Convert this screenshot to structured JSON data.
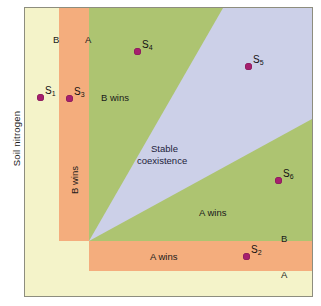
{
  "figure": {
    "type": "resource-competition-phase-diagram",
    "axis": {
      "y_label": "Soil nitrogen",
      "x_label": ""
    },
    "colors": {
      "background": "#f4f3c9",
      "neither_wins": "#f4f3c9",
      "b_wins_strip": "#f4ad7d",
      "green_region": "#adc471",
      "stable_coexistence": "#ccd0e8",
      "marker": "#a61f6e",
      "frame": "#8d8d7e"
    },
    "regions": [
      {
        "id": "b-wins-vertical",
        "label": "B wins",
        "orientation": "vertical",
        "color": "#f4ad7d"
      },
      {
        "id": "b-wins-green",
        "label": "B wins",
        "orientation": "horizontal",
        "color": "#adc471"
      },
      {
        "id": "stable-coexistence",
        "label_line1": "Stable",
        "label_line2": "coexistence",
        "color": "#ccd0e8"
      },
      {
        "id": "a-wins-green",
        "label": "A wins",
        "orientation": "horizontal",
        "color": "#adc471"
      },
      {
        "id": "a-wins-orange",
        "label": "A wins",
        "orientation": "horizontal",
        "color": "#f4ad7d"
      }
    ],
    "boundary_labels": {
      "top_b": "B",
      "top_a": "A",
      "right_b": "B",
      "right_a": "A"
    },
    "species": [
      {
        "id": "S1",
        "label": "S",
        "sub": "1",
        "x": 40,
        "y": 97
      },
      {
        "id": "S3",
        "label": "S",
        "sub": "3",
        "x": 69,
        "y": 98
      },
      {
        "id": "S4",
        "label": "S",
        "sub": "4",
        "x": 137,
        "y": 51
      },
      {
        "id": "S5",
        "label": "S",
        "sub": "5",
        "x": 248,
        "y": 66
      },
      {
        "id": "S6",
        "label": "S",
        "sub": "6",
        "x": 278,
        "y": 180
      },
      {
        "id": "S2",
        "label": "S",
        "sub": "2",
        "x": 246,
        "y": 256
      }
    ]
  }
}
